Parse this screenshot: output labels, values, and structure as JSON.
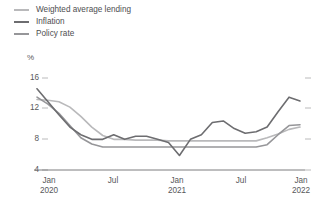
{
  "legend": {
    "position": "top-left",
    "items": [
      {
        "label": "Weighted average lending",
        "color": "#b9b9bb",
        "key": "weighted_average_lending"
      },
      {
        "label": "Inflation",
        "color": "#6d6d70",
        "key": "inflation"
      },
      {
        "label": "Policy rate",
        "color": "#969699",
        "key": "policy_rate"
      }
    ]
  },
  "axis": {
    "unit": "%",
    "y_ticks": [
      "16",
      "12",
      "8",
      "4"
    ],
    "x_ticks": [
      {
        "line1": "Jan",
        "line2": "2020"
      },
      {
        "line1": "Jul",
        "line2": ""
      },
      {
        "line1": "Jan",
        "line2": "2021"
      },
      {
        "line1": "Jul",
        "line2": ""
      },
      {
        "line1": "Jan",
        "line2": "2022"
      }
    ]
  },
  "chart_data": {
    "type": "line",
    "title": "",
    "xlabel": "",
    "ylabel": "%",
    "ylim": [
      4,
      16
    ],
    "grid": false,
    "legend_position": "top-left",
    "x": [
      "Jan 2020",
      "Feb 2020",
      "Mar 2020",
      "Apr 2020",
      "May 2020",
      "Jun 2020",
      "Jul 2020",
      "Aug 2020",
      "Sep 2020",
      "Oct 2020",
      "Nov 2020",
      "Dec 2020",
      "Jan 2021",
      "Feb 2021",
      "Mar 2021",
      "Apr 2021",
      "May 2021",
      "Jun 2021",
      "Jul 2021",
      "Aug 2021",
      "Sep 2021",
      "Oct 2021",
      "Nov 2021",
      "Dec 2021",
      "Jan 2022"
    ],
    "series": [
      {
        "name": "Weighted average lending",
        "color": "#b9b9bb",
        "values": [
          13.2,
          13.1,
          12.9,
          12.2,
          11.0,
          9.6,
          8.5,
          8.0,
          8.0,
          7.9,
          7.9,
          7.9,
          7.8,
          7.8,
          7.8,
          7.8,
          7.8,
          7.8,
          7.8,
          7.8,
          7.8,
          8.2,
          8.7,
          9.3,
          9.6
        ]
      },
      {
        "name": "Inflation",
        "color": "#6d6d70",
        "values": [
          14.6,
          12.9,
          11.2,
          9.6,
          8.6,
          8.0,
          8.0,
          8.6,
          8.0,
          8.4,
          8.4,
          8.0,
          7.6,
          5.9,
          8.0,
          8.6,
          10.2,
          10.4,
          9.4,
          8.8,
          9.0,
          9.6,
          11.6,
          13.5,
          13.0
        ]
      },
      {
        "name": "Policy rate",
        "color": "#969699",
        "values": [
          13.5,
          12.6,
          11.4,
          9.8,
          8.2,
          7.4,
          7.0,
          7.0,
          7.0,
          7.0,
          7.0,
          7.0,
          7.0,
          7.0,
          7.0,
          7.0,
          7.0,
          7.0,
          7.0,
          7.0,
          7.0,
          7.3,
          8.6,
          9.8,
          9.9
        ]
      }
    ]
  }
}
